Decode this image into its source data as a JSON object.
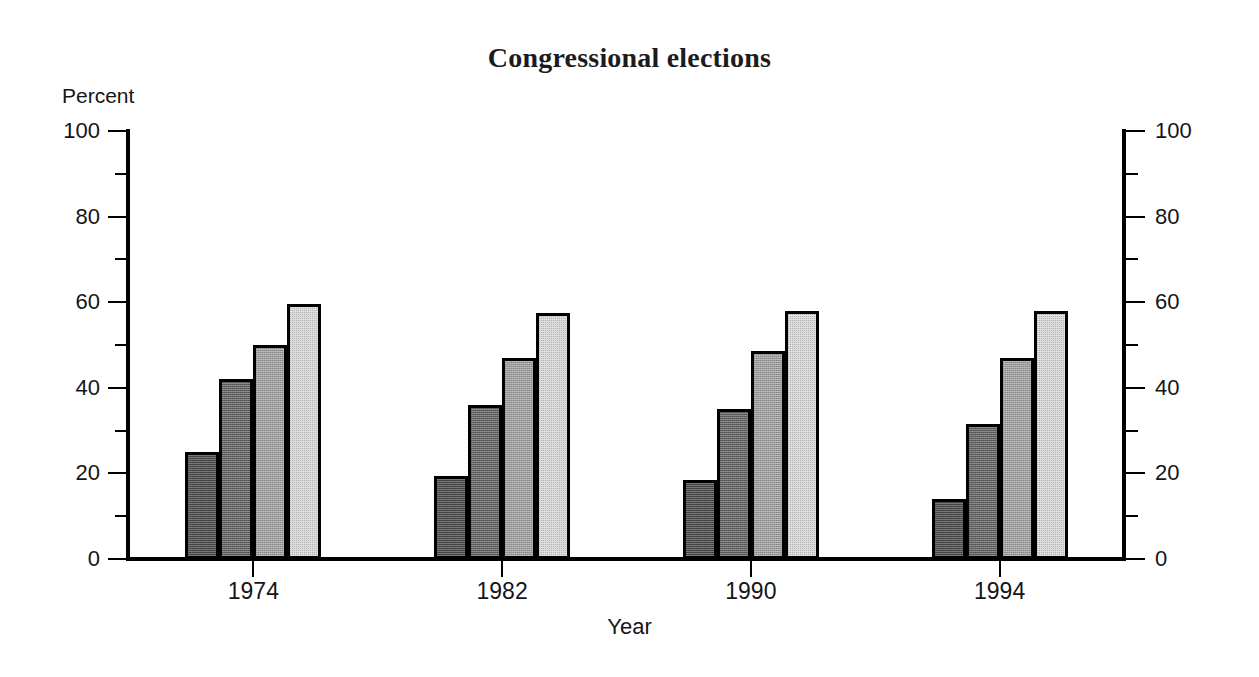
{
  "chart_data": {
    "type": "bar",
    "title": "Congressional elections",
    "xlabel": "Year",
    "ylabel": "Percent",
    "categories": [
      "1974",
      "1982",
      "1990",
      "1994"
    ],
    "series": [
      {
        "name": "series-1",
        "color": "#4a4a4a",
        "values": [
          25.0,
          19.5,
          18.5,
          14.0
        ]
      },
      {
        "name": "series-2",
        "color": "#626262",
        "values": [
          42.0,
          36.0,
          35.0,
          31.5
        ]
      },
      {
        "name": "series-3",
        "color": "#a0a0a0",
        "values": [
          50.0,
          47.0,
          48.5,
          47.0
        ]
      },
      {
        "name": "series-4",
        "color": "#d9d9d9",
        "values": [
          59.5,
          57.5,
          58.0,
          58.0
        ]
      }
    ],
    "ylim": [
      0,
      100
    ],
    "y_ticks_major": [
      0,
      20,
      40,
      60,
      80,
      100
    ],
    "y_ticks_minor": [
      10,
      30,
      50,
      70,
      90
    ],
    "y_axis_left_labels": [
      "0",
      "20",
      "40",
      "60",
      "80",
      "100"
    ],
    "y_axis_right_labels": [
      "0",
      "20",
      "40",
      "60",
      "80",
      "100"
    ],
    "grid": false,
    "legend": null,
    "legend_position": "none",
    "axis_color": "#000000",
    "background": "#ffffff"
  },
  "figure": {
    "title": "Congressional elections",
    "y_unit_label": "Percent",
    "x_axis_title": "Year"
  }
}
